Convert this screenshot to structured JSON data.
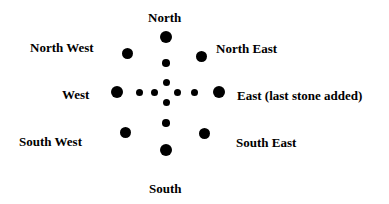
{
  "diagram": {
    "labels": {
      "north": "North",
      "north_west": "North West",
      "north_east": "North East",
      "west": "West",
      "east": "East (last stone added)",
      "south_west": "South West",
      "south_east": "South East",
      "south": "South"
    },
    "colors": {
      "stone": "#000000",
      "text": "#000000",
      "background": "#ffffff"
    },
    "center": {
      "x": 166,
      "y": 92
    },
    "stones": [
      {
        "id": "north-large",
        "x": 166,
        "y": 37,
        "r": 6
      },
      {
        "id": "north-outer-small",
        "x": 166,
        "y": 63,
        "r": 3.8
      },
      {
        "id": "north-inner-small",
        "x": 166,
        "y": 82,
        "r": 3.5
      },
      {
        "id": "south-inner-small",
        "x": 166,
        "y": 102,
        "r": 3.5
      },
      {
        "id": "south-outer-small",
        "x": 166,
        "y": 123,
        "r": 3.8
      },
      {
        "id": "south-large",
        "x": 166,
        "y": 150,
        "r": 6
      },
      {
        "id": "west-large",
        "x": 117,
        "y": 92,
        "r": 6
      },
      {
        "id": "west-outer-small",
        "x": 139,
        "y": 92,
        "r": 3.5
      },
      {
        "id": "west-inner-small",
        "x": 154,
        "y": 92,
        "r": 3.5
      },
      {
        "id": "east-inner-small",
        "x": 177,
        "y": 92,
        "r": 3.5
      },
      {
        "id": "east-outer-small",
        "x": 194,
        "y": 92,
        "r": 3.5
      },
      {
        "id": "east-large",
        "x": 219,
        "y": 92,
        "r": 6
      },
      {
        "id": "north-west-large",
        "x": 127,
        "y": 53,
        "r": 5.5
      },
      {
        "id": "north-east-large",
        "x": 201,
        "y": 56,
        "r": 5.5
      },
      {
        "id": "south-west-large",
        "x": 125,
        "y": 132,
        "r": 5.5
      },
      {
        "id": "south-east-large",
        "x": 204,
        "y": 133,
        "r": 5.5
      }
    ]
  }
}
